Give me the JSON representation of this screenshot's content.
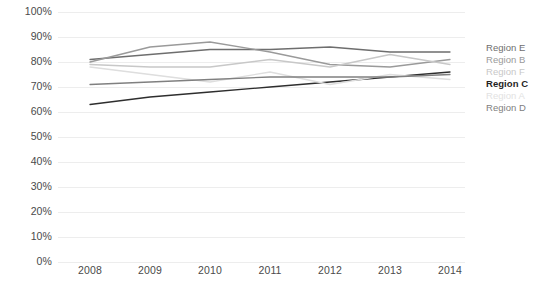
{
  "chart_data": {
    "type": "line",
    "title": "",
    "subtitle": "",
    "xlabel": "",
    "ylabel": "",
    "x": [
      "2008",
      "2009",
      "2010",
      "2011",
      "2012",
      "2013",
      "2014"
    ],
    "categories": [
      "2008",
      "2009",
      "2010",
      "2011",
      "2012",
      "2013",
      "2014"
    ],
    "ylim": [
      0,
      100
    ],
    "y_ticks": [
      "0%",
      "10%",
      "20%",
      "30%",
      "40%",
      "50%",
      "60%",
      "70%",
      "80%",
      "90%",
      "100%"
    ],
    "y_tick_values": [
      0,
      10,
      20,
      30,
      40,
      50,
      60,
      70,
      80,
      90,
      100
    ],
    "y_tick_suffix": "%",
    "grid": "horizontal",
    "legend_position": "right",
    "series": [
      {
        "name": "Region E",
        "color": "#6e6e6e",
        "values": [
          81,
          83,
          85,
          85,
          86,
          84,
          84
        ]
      },
      {
        "name": "Region B",
        "color": "#9a9a9a",
        "values": [
          80,
          86,
          88,
          84,
          79,
          78,
          81
        ]
      },
      {
        "name": "Region F",
        "color": "#c8c8c8",
        "values": [
          79,
          78,
          78,
          81,
          78,
          83,
          79
        ]
      },
      {
        "name": "Region C",
        "color": "#2e2e2e",
        "values": [
          63,
          66,
          68,
          70,
          72,
          74,
          76
        ]
      },
      {
        "name": "Region A",
        "color": "#dedede",
        "values": [
          78,
          75,
          72,
          76,
          71,
          75,
          73
        ]
      },
      {
        "name": "Region D",
        "color": "#808080",
        "values": [
          71,
          72,
          73,
          74,
          74,
          74,
          75
        ]
      }
    ]
  },
  "legend": {
    "items": [
      {
        "label": "Region E",
        "color": "#6e6e6e",
        "weight": "normal"
      },
      {
        "label": "Region B",
        "color": "#9a9a9a",
        "weight": "normal"
      },
      {
        "label": "Region F",
        "color": "#c8c8c8",
        "weight": "normal"
      },
      {
        "label": "Region C",
        "color": "#1f1f1f",
        "weight": "bold"
      },
      {
        "label": "Region A",
        "color": "#e2e2e2",
        "weight": "normal"
      },
      {
        "label": "Region D",
        "color": "#808080",
        "weight": "normal"
      }
    ]
  },
  "axes": {
    "grid_color": "#ededed",
    "tick_label_color": "#4a4a4a"
  }
}
